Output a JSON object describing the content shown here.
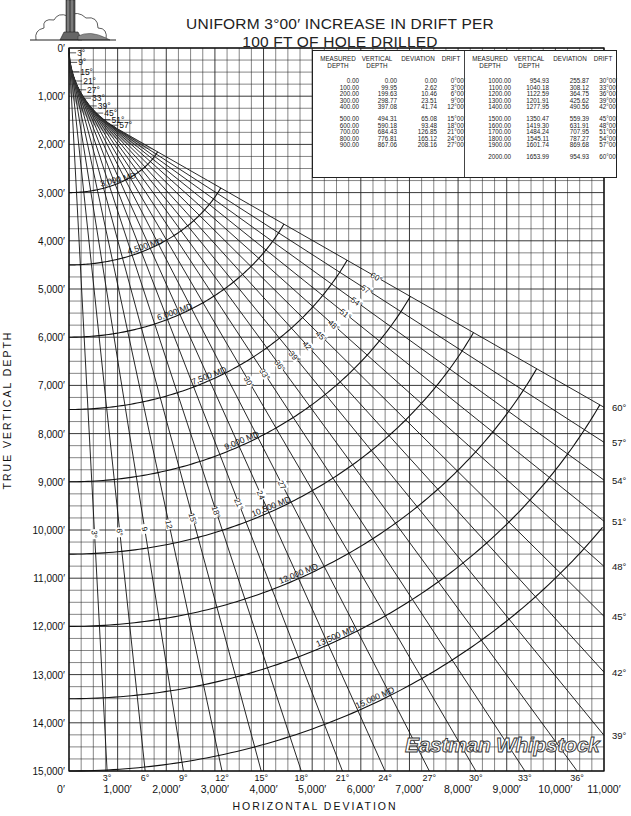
{
  "chart_data": {
    "type": "line",
    "title": "UNIFORM 3°00′ INCREASE IN DRIFT PER",
    "subtitle": "100 FT OF HOLE DRILLED",
    "xlabel": "HORIZONTAL DEVIATION",
    "ylabel": "TRUE VERTICAL DEPTH",
    "build_rate_deg_per_100ft": 3,
    "xlim": [
      0,
      11000
    ],
    "ylim": [
      0,
      15000
    ],
    "y_inverted": true,
    "grid": true,
    "x_ticks": [
      "0′",
      "1,000′",
      "2,000′",
      "3,000′",
      "4,000′",
      "5,000′",
      "6,000′",
      "7,000′",
      "8,000′",
      "9,000′",
      "10,000′",
      "11,000′"
    ],
    "y_ticks": [
      "0′",
      "1,000′",
      "2,000′",
      "3,000′",
      "4,000′",
      "5,000′",
      "6,000′",
      "7,000′",
      "8,000′",
      "9,000′",
      "10,000′",
      "11,000′",
      "12,000′",
      "13,000′",
      "14,000′",
      "15,000′"
    ],
    "hold_angle_lines_deg": [
      3,
      6,
      9,
      12,
      15,
      18,
      21,
      24,
      27,
      30,
      33,
      36,
      39,
      42,
      45,
      48,
      51,
      54,
      57,
      60
    ],
    "build_curve_labels": [
      "3°",
      "9°",
      "15°",
      "21°",
      "27°",
      "33°",
      "39°",
      "45°",
      "51°",
      "57°"
    ],
    "bottom_angle_labels": [
      "3°",
      "6°",
      "9°",
      "12°",
      "15°",
      "18°",
      "21°",
      "24°",
      "27°",
      "30°",
      "33°",
      "36°"
    ],
    "right_angle_labels": [
      "60°",
      "57°",
      "54°",
      "51°",
      "48°",
      "45°",
      "42°",
      "39°"
    ],
    "inner_angle_labels": [
      "3°",
      "6°",
      "9",
      "12",
      "15°",
      "18°",
      "21°",
      "24",
      "27",
      "30°",
      "33°",
      "36°",
      "39°",
      "42°",
      "45°",
      "48°",
      "51°",
      "54°",
      "57°",
      "60°"
    ],
    "md_curves_ft": [
      3000,
      4500,
      6000,
      7500,
      9000,
      10500,
      12000,
      13500,
      15000
    ],
    "md_curve_labels": [
      "3,000 MD",
      "4,500 MD",
      "6,000 MD",
      "7,500 MD",
      "9,000 MD",
      "10,500 MD",
      "12,000 MD",
      "13,500 MD",
      "15,000 MD"
    ],
    "table": {
      "headers": [
        "MEASURED DEPTH",
        "VERTICAL DEPTH",
        "DEVIATION",
        "DRIFT"
      ],
      "rows": [
        [
          "0.00",
          "0.00",
          "0.00",
          "0°00′"
        ],
        [
          "100.00",
          "99.95",
          "2.62",
          "3°00′"
        ],
        [
          "200.00",
          "199.63",
          "10.46",
          "6°00′"
        ],
        [
          "300.00",
          "298.77",
          "23.51",
          "9°00′"
        ],
        [
          "400.00",
          "397.08",
          "41.74",
          "12°00′"
        ],
        [
          "500.00",
          "494.31",
          "65.08",
          "15°00′"
        ],
        [
          "600.00",
          "590.18",
          "93.48",
          "18°00′"
        ],
        [
          "700.00",
          "684.43",
          "126.85",
          "21°00′"
        ],
        [
          "800.00",
          "776.81",
          "165.12",
          "24°00′"
        ],
        [
          "900.00",
          "867.06",
          "208.16",
          "27°00′"
        ],
        [
          "1000.00",
          "954.93",
          "255.87",
          "30°00′"
        ],
        [
          "1100.00",
          "1040.18",
          "308.12",
          "33°00′"
        ],
        [
          "1200.00",
          "1122.59",
          "364.75",
          "36°00′"
        ],
        [
          "1300.00",
          "1201.91",
          "425.62",
          "39°00′"
        ],
        [
          "1400.00",
          "1277.95",
          "490.56",
          "42°00′"
        ],
        [
          "1500.00",
          "1350.47",
          "559.39",
          "45°00′"
        ],
        [
          "1600.00",
          "1419.30",
          "631.91",
          "48°00′"
        ],
        [
          "1700.00",
          "1484.24",
          "707.95",
          "51°00′"
        ],
        [
          "1800.00",
          "1545.11",
          "787.27",
          "54°00′"
        ],
        [
          "1900.00",
          "1601.74",
          "869.68",
          "57°00′"
        ],
        [
          "2000.00",
          "1653.99",
          "954.93",
          "60°00′"
        ]
      ]
    },
    "watermark": "Eastman Whipstock"
  }
}
